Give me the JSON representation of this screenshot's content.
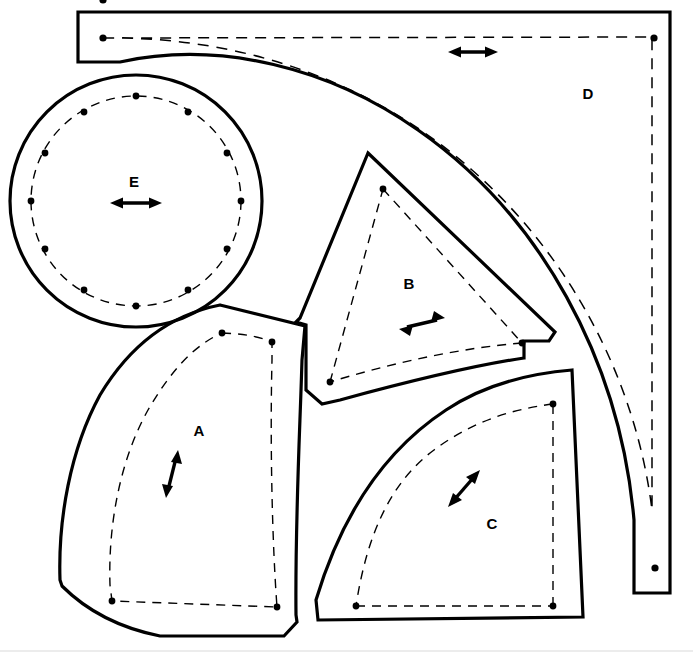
{
  "document": {
    "kind": "sewing-pattern-layout",
    "title": "",
    "canvas": {
      "width": 693,
      "height": 658,
      "background": "#ffffff"
    },
    "line_styles": {
      "cutting_line": "solid",
      "stitching_line": "dashed",
      "marker": "dot",
      "grainline": "double-headed-arrow"
    },
    "colors": {
      "ink": "#000000",
      "paper": "#ffffff",
      "faint_rule": "#d9d9d9"
    }
  },
  "pieces": [
    {
      "id": "A",
      "label": "A",
      "label_pos": {
        "x": 198,
        "y": 430
      },
      "grainline": {
        "x1": 166,
        "y1": 497,
        "x2": 178,
        "y2": 451,
        "direction": "vertical-tilted"
      },
      "cut_path": "M 220 305 L 305 326 L 302 360 C 300 430 295 520 296 615 L 297 622 L 284 636 L 160 636 C 120 628 86 610 62 586 L 60 580 C 58 520 70 450 100 395 C 130 345 170 315 220 305 Z",
      "stitch_path": "M 222 333 C 250 334 262 338 272 342 L 272 360 C 270 440 272 540 277 607 L 112 601 L 110 585 C 108 525 120 460 148 410 C 170 372 194 345 222 333",
      "dots": [
        {
          "x": 222,
          "y": 333
        },
        {
          "x": 272,
          "y": 342
        },
        {
          "x": 112,
          "y": 601
        },
        {
          "x": 277,
          "y": 607
        }
      ]
    },
    {
      "id": "B",
      "label": "B",
      "label_pos": {
        "x": 408,
        "y": 283
      },
      "grainline": {
        "x1": 400,
        "y1": 328,
        "x2": 444,
        "y2": 318,
        "direction": "horizontal-tilted"
      },
      "cut_path": "M 368 153 L 555 332 L 549 341 L 524 341 L 524 358 C 470 366 406 382 340 400 L 322 404 L 306 390 L 306 325 L 296 322 L 300 318 Z",
      "stitch_path": "M 383 189 L 522 343 M 522 343 C 460 348 392 363 330 382 M 330 382 L 383 189",
      "dots": [
        {
          "x": 383,
          "y": 189
        },
        {
          "x": 522,
          "y": 343
        },
        {
          "x": 330,
          "y": 382
        }
      ]
    },
    {
      "id": "C",
      "label": "C",
      "label_pos": {
        "x": 491,
        "y": 523
      },
      "grainline": {
        "x1": 449,
        "y1": 505,
        "x2": 477,
        "y2": 472,
        "direction": "diagonal"
      },
      "cut_path": "M 572 370 L 583 617 L 318 620 L 316 600 C 340 520 382 452 446 410 C 482 386 524 374 572 370 Z",
      "stitch_path": "M 553 404 C 504 410 466 426 434 450 C 388 484 366 540 356 606 M 356 606 L 553 606 M 553 606 L 553 404",
      "dots": [
        {
          "x": 553,
          "y": 404
        },
        {
          "x": 356,
          "y": 606
        },
        {
          "x": 553,
          "y": 606
        }
      ]
    },
    {
      "id": "D",
      "label": "D",
      "label_pos": {
        "x": 588,
        "y": 93
      },
      "grainline": {
        "x1": 450,
        "y1": 52,
        "x2": 496,
        "y2": 52,
        "direction": "horizontal"
      },
      "cut_path": "M 78 12 L 670 12 L 670 593 L 634 593 L 634 520 C 620 360 540 215 418 130 C 330 68 220 40 120 62 L 78 62 Z",
      "stitch_path": "M 103 38 C 240 36 370 80 472 170 C 570 256 636 380 652 510 L 652 37 Z",
      "dots": [
        {
          "x": 103,
          "y": 38
        },
        {
          "x": 654,
          "y": 38
        },
        {
          "x": 655,
          "y": 568
        }
      ]
    },
    {
      "id": "E",
      "label": "E",
      "label_pos": {
        "x": 134,
        "y": 182
      },
      "grainline": {
        "x1": 112,
        "y1": 203,
        "x2": 160,
        "y2": 203,
        "direction": "horizontal"
      },
      "shape": "circle",
      "circle": {
        "cx": 136,
        "cy": 201,
        "r_cut": 126,
        "r_stitch": 105
      },
      "dots": [
        {
          "x": 136,
          "y": 96
        },
        {
          "x": 190,
          "y": 111
        },
        {
          "x": 226,
          "y": 152
        },
        {
          "x": 240,
          "y": 201
        },
        {
          "x": 226,
          "y": 250
        },
        {
          "x": 190,
          "y": 291
        },
        {
          "x": 136,
          "y": 306
        },
        {
          "x": 82,
          "y": 291
        },
        {
          "x": 46,
          "y": 250
        },
        {
          "x": 31,
          "y": 201
        },
        {
          "x": 46,
          "y": 152
        },
        {
          "x": 82,
          "y": 111
        }
      ]
    }
  ],
  "footer_rule": {
    "y": 651,
    "x1": 0,
    "x2": 693
  }
}
